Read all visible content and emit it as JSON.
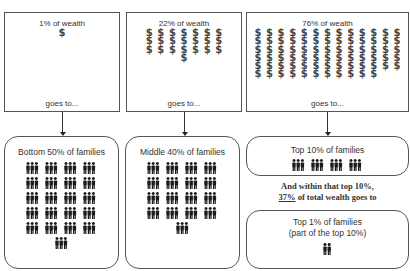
{
  "wealth_boxes": [
    {
      "label": "1% of wealth",
      "dollar_count": 1,
      "columns": 1,
      "footer": "goes to..."
    },
    {
      "label": "22% of wealth",
      "dollar_count": 22,
      "columns": 7,
      "footer": "goes to..."
    },
    {
      "label": "76% of wealth",
      "dollar_count": 76,
      "columns": 13,
      "footer": "goes to..."
    }
  ],
  "family_boxes": [
    {
      "label": "Bottom 50% of families",
      "icon_count": 21,
      "icon": "family-group-icon"
    },
    {
      "label": "Middle 40% of families",
      "icon_count": 17,
      "icon": "family-group-icon"
    },
    {
      "label": "Top 10% of families",
      "icon_count": 4,
      "icon": "family-group-icon"
    },
    {
      "label": "Top 1% of families",
      "sublabel": "(part of the top 10%)",
      "icon_count": 1,
      "icon": "couple-icon"
    }
  ],
  "connector_text": {
    "line1": "And within that top 10%,",
    "line2_percent": "37%",
    "line2_rest": " of total wealth goes to"
  },
  "symbols": {
    "dollar": "$"
  },
  "colors": {
    "border": "#555555",
    "icon": "#1a1a1a",
    "text": "#333333"
  }
}
